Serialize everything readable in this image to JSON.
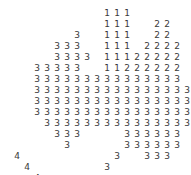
{
  "canvas": {
    "width": 191,
    "height": 175,
    "background": "#ffffff",
    "glyph_color": "#3a3a3a",
    "cell_width": 10,
    "cell_height": 11,
    "origin_x": 12,
    "origin_y": 8,
    "rows": 16,
    "cols": 18
  },
  "chart_data": {
    "type": "heatmap",
    "title": "",
    "xlabel": "",
    "ylabel": "",
    "legend": [
      "1",
      "2",
      "3",
      "4"
    ],
    "grid": [
      [
        null,
        null,
        null,
        null,
        null,
        null,
        null,
        null,
        null,
        "1",
        "1",
        "1",
        null,
        null,
        null,
        null,
        null,
        null
      ],
      [
        null,
        null,
        null,
        null,
        null,
        null,
        null,
        null,
        null,
        "1",
        "1",
        "1",
        null,
        null,
        "2",
        "2",
        null,
        null
      ],
      [
        null,
        null,
        null,
        null,
        null,
        null,
        "3",
        null,
        null,
        "1",
        "1",
        "1",
        null,
        null,
        "2",
        "2",
        null,
        null
      ],
      [
        null,
        null,
        null,
        null,
        "3",
        "3",
        "3",
        null,
        null,
        "1",
        "1",
        "1",
        null,
        "2",
        "2",
        "2",
        "2",
        null
      ],
      [
        null,
        null,
        null,
        null,
        "3",
        "3",
        "3",
        "3",
        null,
        "1",
        "1",
        "1",
        "2",
        "2",
        "2",
        "2",
        "2",
        null
      ],
      [
        null,
        null,
        "3",
        "3",
        "3",
        "3",
        "3",
        null,
        null,
        "1",
        "1",
        "2",
        "2",
        "2",
        "2",
        "2",
        "2",
        null
      ],
      [
        null,
        null,
        "3",
        "3",
        "3",
        "3",
        "3",
        "3",
        "3",
        "3",
        "3",
        "3",
        "3",
        "3",
        "3",
        "3",
        "3",
        null
      ],
      [
        null,
        null,
        "3",
        "3",
        "3",
        "3",
        "3",
        "3",
        "3",
        "3",
        "3",
        "3",
        "3",
        "3",
        "3",
        "3",
        "3",
        "3"
      ],
      [
        null,
        null,
        "3",
        "3",
        "3",
        "3",
        "3",
        "3",
        "3",
        "3",
        "3",
        "3",
        "3",
        "3",
        "3",
        "3",
        "3",
        "3"
      ],
      [
        null,
        null,
        "3",
        "3",
        "3",
        "3",
        "3",
        "3",
        "3",
        "3",
        "3",
        "3",
        "3",
        "3",
        "3",
        "3",
        "3",
        "3"
      ],
      [
        null,
        null,
        null,
        "3",
        "3",
        "3",
        "3",
        "3",
        "3",
        "3",
        "3",
        "3",
        "3",
        "3",
        "3",
        "3",
        "3",
        "3"
      ],
      [
        null,
        null,
        null,
        null,
        "3",
        "3",
        "3",
        null,
        null,
        null,
        null,
        "3",
        "3",
        "3",
        "3",
        "3",
        "3",
        null
      ],
      [
        null,
        null,
        null,
        null,
        null,
        "3",
        null,
        null,
        null,
        null,
        null,
        "3",
        "3",
        "3",
        "3",
        "3",
        "3",
        null
      ],
      [
        "4",
        null,
        null,
        null,
        null,
        null,
        null,
        null,
        null,
        null,
        "3",
        null,
        null,
        "3",
        "3",
        "3",
        null,
        null
      ],
      [
        null,
        "4",
        null,
        null,
        null,
        null,
        null,
        null,
        null,
        "3",
        null,
        null,
        null,
        null,
        null,
        null,
        null,
        null
      ],
      [
        null,
        null,
        "4",
        null,
        null,
        null,
        null,
        null,
        null,
        null,
        null,
        null,
        null,
        null,
        null,
        null,
        null,
        null
      ],
      [
        null,
        null,
        null,
        "4",
        "4",
        "4",
        "4",
        "4",
        "4",
        "4",
        null,
        null,
        null,
        null,
        null,
        null,
        null,
        null
      ],
      [
        null,
        null,
        null,
        "4",
        "4",
        "4",
        "4",
        "4",
        null,
        null,
        null,
        null,
        null,
        null,
        null,
        null,
        null,
        null
      ]
    ]
  }
}
